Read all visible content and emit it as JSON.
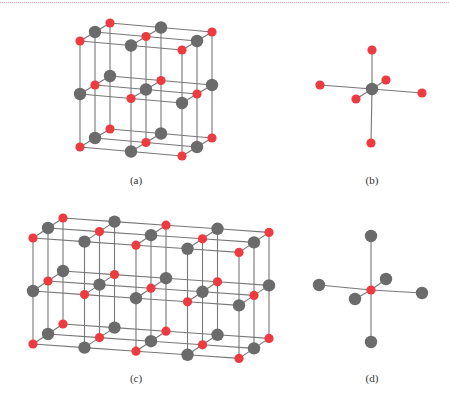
{
  "colors": {
    "red": "#ee3b3f",
    "gray": "#6b6b6b",
    "bond": "#777777",
    "border_dotted": "#e8a0a8"
  },
  "figures": [
    {
      "id": "a",
      "label": "(a)",
      "kind": "lattice",
      "caption_pos": [
        136,
        181
      ],
      "nx": 3,
      "ny": 3,
      "nz": 3,
      "origin": [
        80,
        41
      ],
      "step_x": [
        51,
        4.5
      ],
      "step_y": [
        0,
        53
      ],
      "step_z": [
        15,
        -9
      ],
      "radius_red": 4.6,
      "radius_gray": 6.2,
      "parity_red": 0
    },
    {
      "id": "b",
      "label": "(b)",
      "kind": "coordination",
      "caption_pos": [
        372,
        181
      ],
      "center": [
        372,
        89
      ],
      "center_color": "gray",
      "ligand_color": "red",
      "ligands": [
        [
          372,
          50
        ],
        [
          371,
          143
        ],
        [
          320,
          85
        ],
        [
          422,
          93
        ],
        [
          386,
          80
        ],
        [
          356,
          99
        ]
      ],
      "radius_center": 6.2,
      "radius_ligand": 4.6
    },
    {
      "id": "c",
      "label": "(c)",
      "kind": "lattice",
      "caption_pos": [
        136,
        379
      ],
      "nx": 5,
      "ny": 3,
      "nz": 3,
      "origin": [
        33,
        238
      ],
      "step_x": [
        51.5,
        3.6
      ],
      "step_y": [
        0,
        53
      ],
      "step_z": [
        15,
        -10
      ],
      "radius_red": 4.6,
      "radius_gray": 6.2,
      "parity_red": 0
    },
    {
      "id": "d",
      "label": "(d)",
      "kind": "coordination",
      "caption_pos": [
        372,
        379
      ],
      "center": [
        371,
        290
      ],
      "center_color": "red",
      "ligand_color": "gray",
      "ligands": [
        [
          371,
          236
        ],
        [
          371,
          342
        ],
        [
          319,
          285
        ],
        [
          422,
          293
        ],
        [
          386,
          279
        ],
        [
          355,
          299
        ]
      ],
      "radius_center": 4.6,
      "radius_ligand": 6.2
    }
  ]
}
